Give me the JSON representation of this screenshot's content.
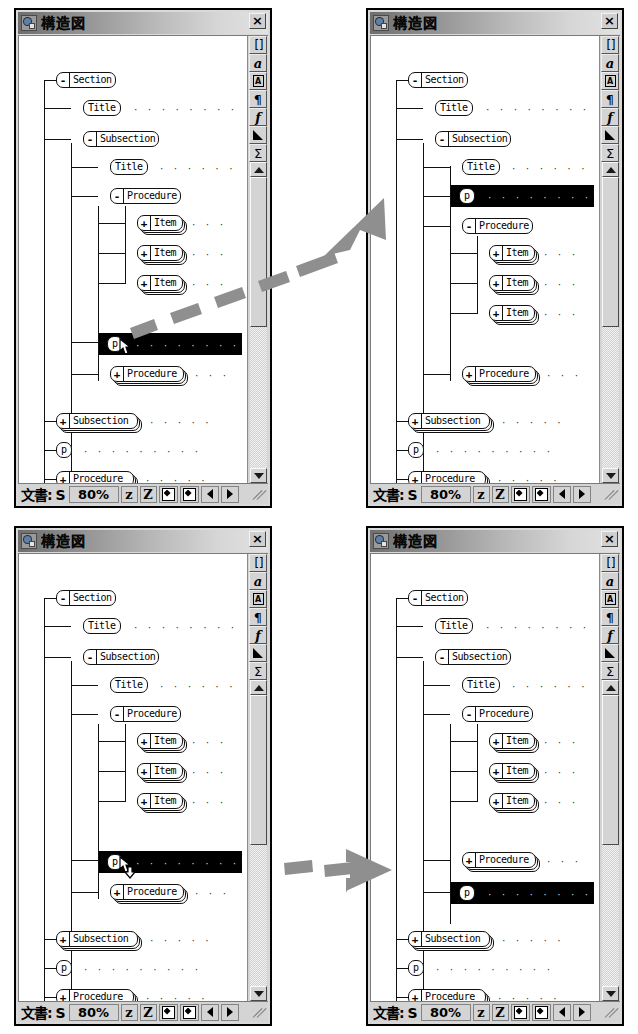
{
  "window": {
    "title": "構造図",
    "close_label": "×",
    "icon": "document-structure-icon"
  },
  "toolstrip": {
    "buttons": [
      {
        "name": "brackets-button",
        "label": "[]"
      },
      {
        "name": "italic-a-button",
        "label": "a"
      },
      {
        "name": "boxed-a-button",
        "label": "A"
      },
      {
        "name": "pilcrow-button",
        "label": "¶"
      },
      {
        "name": "function-f-button",
        "label": "f"
      },
      {
        "name": "delta-triangle-button",
        "label": "◢"
      },
      {
        "name": "sigma-button",
        "label": "Σ"
      }
    ]
  },
  "status_bar": {
    "doc_label": "文書: S",
    "zoom": "80%",
    "zoom_out_label": "z",
    "zoom_in_label": "Z",
    "fit_page_label": "◆",
    "fit_width_label": "◆",
    "prev_label": "◀",
    "next_label": "▶"
  },
  "tree": {
    "nodes": {
      "section": {
        "label": "Section",
        "expander": "-"
      },
      "title": {
        "label": "Title",
        "expander": ""
      },
      "subsection": {
        "label": "Subsection",
        "expander": "-"
      },
      "subtitle": {
        "label": "Title",
        "expander": ""
      },
      "procedure": {
        "label": "Procedure",
        "expander": "-"
      },
      "item": {
        "label": "Item",
        "expander": "+"
      },
      "p": {
        "label": "p",
        "expander": ""
      },
      "procedure_collapsed": {
        "label": "Procedure",
        "expander": "+"
      },
      "subsection_collapsed": {
        "label": "Subsection",
        "expander": "+"
      },
      "p2": {
        "label": "p",
        "expander": ""
      },
      "procedure_bottom": {
        "label": "Procedure",
        "expander": "+"
      }
    },
    "dots": {
      "long": "· · · · · · · · · · · · · · · · · ·",
      "medium": "· · · · · · · · · · ·",
      "short": "· · · · · ·",
      "tiny": "· · · ·"
    },
    "markers": {
      "f": "F",
      "l": "l",
      "one": "1",
      "two": "2",
      "three": "3",
      "slash": "⁄",
      "kanji": "桁",
      "dash": "-",
      "squiggle": "⁖"
    }
  },
  "panels": [
    {
      "id": "top-left",
      "name": "before-drag-up",
      "selected_node": "p",
      "p_position": "below-procedure-group",
      "cursor": "drag-up-cursor"
    },
    {
      "id": "top-right",
      "name": "after-drag-up",
      "selected_node": "p",
      "p_position": "above-procedure",
      "cursor": "none"
    },
    {
      "id": "bottom-left",
      "name": "before-drag-down",
      "selected_node": "p",
      "p_position": "above-procedure-collapsed",
      "cursor": "drag-down-cursor"
    },
    {
      "id": "bottom-right",
      "name": "after-drag-down",
      "selected_node": "p",
      "p_position": "below-procedure-collapsed",
      "cursor": "none"
    }
  ],
  "arrows": [
    {
      "name": "drag-up-arrow",
      "direction": "up-right",
      "style": "dashed-thick-gray"
    },
    {
      "name": "drag-down-arrow",
      "direction": "right",
      "style": "dashed-thick-gray"
    }
  ]
}
